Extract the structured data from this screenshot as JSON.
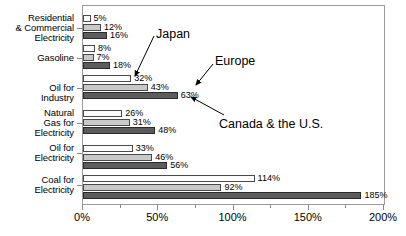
{
  "chart_data": {
    "type": "bar",
    "orientation": "horizontal",
    "title": "",
    "subtitle": "",
    "xlabel": "",
    "ylabel": "",
    "xlim": [
      0,
      200
    ],
    "xunit": "%",
    "grid": false,
    "legend_position": "none",
    "legend_style": "arrow-annotations",
    "categories": [
      "Residential\n& Commercial\nElectricity",
      "Gasoline",
      "Oil for\nIndustry",
      "Natural\nGas  for\nElectricity",
      "Oil for\nElectricity",
      "Coal for\nElectricity"
    ],
    "category_lines": [
      [
        "Residential",
        "& Commercial",
        "Electricity"
      ],
      [
        "Gasoline"
      ],
      [
        "Oil for",
        "Industry"
      ],
      [
        "Natural",
        "Gas  for",
        "Electricity"
      ],
      [
        "Oil for",
        "Electricity"
      ],
      [
        "Coal for",
        "Electricity"
      ]
    ],
    "series": [
      {
        "name": "Japan",
        "color": "#fcfcfc",
        "values": [
          5,
          8,
          32,
          26,
          33,
          114
        ],
        "labels": [
          "5%",
          "8%",
          "32%",
          "26%",
          "33%",
          "114%"
        ]
      },
      {
        "name": "Europe",
        "color": "#c9c9c9",
        "values": [
          12,
          7,
          43,
          31,
          46,
          92
        ],
        "labels": [
          "12%",
          "7%",
          "43%",
          "31%",
          "46%",
          "92%"
        ]
      },
      {
        "name": "Canada & the U.S.",
        "color": "#5c5c5c",
        "values": [
          16,
          18,
          63,
          48,
          56,
          185
        ],
        "labels": [
          "16%",
          "18%",
          "63%",
          "48%",
          "56%",
          "185%"
        ]
      }
    ],
    "xticks_major": [
      0,
      50,
      100,
      150,
      200
    ],
    "xtick_labels": [
      "0%",
      "50%",
      "100%",
      "150%",
      "200%"
    ],
    "xticks_minor": [
      25,
      75,
      125,
      175
    ],
    "annotations": [
      {
        "text": "Japan",
        "points_to_series": 0,
        "points_to_category": 2
      },
      {
        "text": "Europe",
        "points_to_series": 1,
        "points_to_category": 2
      },
      {
        "text": "Canada & the U.S.",
        "points_to_series": 2,
        "points_to_category": 2
      }
    ]
  }
}
